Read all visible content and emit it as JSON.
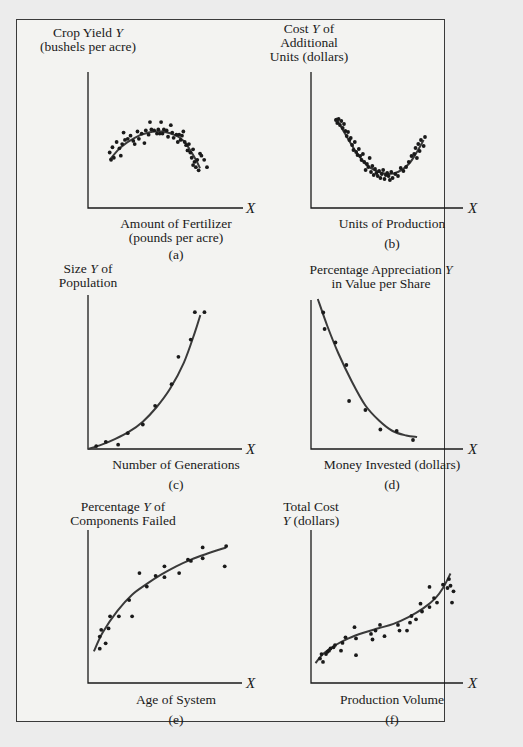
{
  "figure": {
    "panels": [
      {
        "id": "a",
        "ylabel_lines": [
          "Crop Yield Y",
          "(bushels per acre)"
        ],
        "xlabel_lines": [
          "Amount of Fertilizer",
          "(pounds per acre)"
        ],
        "x_var": "X",
        "caption": "(a)"
      },
      {
        "id": "b",
        "ylabel_lines": [
          "Cost Y of",
          "Additional",
          "Units (dollars)"
        ],
        "xlabel_lines": [
          "Units of Production"
        ],
        "x_var": "X",
        "caption": "(b)"
      },
      {
        "id": "c",
        "ylabel_lines": [
          "Size Y of",
          "Population"
        ],
        "xlabel_lines": [
          "Number of Generations"
        ],
        "x_var": "X",
        "caption": "(c)"
      },
      {
        "id": "d",
        "ylabel_lines": [
          "Percentage Appreciation Y",
          "in Value per Share"
        ],
        "xlabel_lines": [
          "Money Invested (dollars)"
        ],
        "x_var": "X",
        "caption": "(d)"
      },
      {
        "id": "e",
        "ylabel_lines": [
          "Percentage Y of",
          "Components Failed"
        ],
        "xlabel_lines": [
          "Age of System"
        ],
        "x_var": "X",
        "caption": "(e)"
      },
      {
        "id": "f",
        "ylabel_lines": [
          "Total Cost",
          "Y (dollars)"
        ],
        "xlabel_lines": [
          "Production Volume"
        ],
        "x_var": "X",
        "caption": "(f)"
      }
    ],
    "colors": {
      "ink": "#1a1a1a",
      "curve": "#3a3a3a",
      "paper": "#f3f3f1",
      "background": "#ececec"
    }
  },
  "chart_data": [
    {
      "id": "a",
      "type": "scatter",
      "title": "",
      "xlabel": "Amount of Fertilizer (pounds per acre)",
      "ylabel": "Crop Yield Y (bushels per acre)",
      "grid": false,
      "legend": null,
      "ticks": "none",
      "fit": "quadratic (concave, inverted U)",
      "xlim": [
        0,
        100
      ],
      "ylim": [
        0,
        100
      ],
      "points": [
        [
          12,
          50
        ],
        [
          13,
          43
        ],
        [
          14,
          55
        ],
        [
          15,
          45
        ],
        [
          17,
          60
        ],
        [
          19,
          54
        ],
        [
          20,
          47
        ],
        [
          21,
          58
        ],
        [
          22,
          69
        ],
        [
          23,
          62
        ],
        [
          25,
          63
        ],
        [
          27,
          66
        ],
        [
          29,
          61
        ],
        [
          30,
          58
        ],
        [
          32,
          70
        ],
        [
          33,
          63
        ],
        [
          35,
          68
        ],
        [
          37,
          59
        ],
        [
          38,
          71
        ],
        [
          40,
          67
        ],
        [
          41,
          79
        ],
        [
          42,
          72
        ],
        [
          44,
          71
        ],
        [
          46,
          68
        ],
        [
          47,
          72
        ],
        [
          48,
          68
        ],
        [
          49,
          79
        ],
        [
          50,
          68
        ],
        [
          51,
          72
        ],
        [
          53,
          71
        ],
        [
          54,
          65
        ],
        [
          56,
          76
        ],
        [
          57,
          69
        ],
        [
          58,
          64
        ],
        [
          60,
          67
        ],
        [
          61,
          60
        ],
        [
          62,
          67
        ],
        [
          63,
          62
        ],
        [
          64,
          66
        ],
        [
          65,
          70
        ],
        [
          66,
          60
        ],
        [
          67,
          57
        ],
        [
          68,
          52
        ],
        [
          69,
          58
        ],
        [
          70,
          50
        ],
        [
          71,
          45
        ],
        [
          72,
          38
        ],
        [
          72,
          53
        ],
        [
          73,
          41
        ],
        [
          74,
          36
        ],
        [
          75,
          43
        ],
        [
          76,
          33
        ],
        [
          77,
          49
        ],
        [
          78,
          47
        ],
        [
          80,
          43
        ],
        [
          82,
          36
        ]
      ],
      "curve": [
        [
          12,
          43
        ],
        [
          20,
          55
        ],
        [
          30,
          64
        ],
        [
          40,
          69
        ],
        [
          50,
          70
        ],
        [
          60,
          66
        ],
        [
          66,
          60
        ],
        [
          70,
          52
        ],
        [
          74,
          43
        ],
        [
          77,
          35
        ]
      ]
    },
    {
      "id": "b",
      "type": "scatter",
      "title": "",
      "xlabel": "Units of Production",
      "ylabel": "Cost Y of Additional Units (dollars)",
      "grid": false,
      "legend": null,
      "ticks": "none",
      "fit": "quadratic (convex, U-shaped)",
      "xlim": [
        0,
        100
      ],
      "ylim": [
        0,
        100
      ],
      "points": [
        [
          14,
          80
        ],
        [
          15,
          77
        ],
        [
          16,
          81
        ],
        [
          17,
          75
        ],
        [
          18,
          79
        ],
        [
          19,
          72
        ],
        [
          20,
          76
        ],
        [
          21,
          69
        ],
        [
          22,
          64
        ],
        [
          23,
          68
        ],
        [
          24,
          60
        ],
        [
          25,
          62
        ],
        [
          26,
          55
        ],
        [
          27,
          50
        ],
        [
          28,
          58
        ],
        [
          29,
          48
        ],
        [
          30,
          45
        ],
        [
          31,
          51
        ],
        [
          32,
          44
        ],
        [
          33,
          40
        ],
        [
          34,
          46
        ],
        [
          35,
          38
        ],
        [
          36,
          30
        ],
        [
          37,
          36
        ],
        [
          38,
          33
        ],
        [
          39,
          42
        ],
        [
          40,
          28
        ],
        [
          41,
          34
        ],
        [
          42,
          25
        ],
        [
          43,
          31
        ],
        [
          44,
          27
        ],
        [
          45,
          24
        ],
        [
          46,
          29
        ],
        [
          47,
          22
        ],
        [
          48,
          26
        ],
        [
          49,
          30
        ],
        [
          50,
          21
        ],
        [
          51,
          25
        ],
        [
          52,
          27
        ],
        [
          53,
          24
        ],
        [
          54,
          20
        ],
        [
          55,
          28
        ],
        [
          56,
          22
        ],
        [
          58,
          26
        ],
        [
          60,
          24
        ],
        [
          62,
          32
        ],
        [
          64,
          29
        ],
        [
          66,
          33
        ],
        [
          68,
          38
        ],
        [
          70,
          44
        ],
        [
          72,
          46
        ],
        [
          73,
          52
        ],
        [
          74,
          42
        ],
        [
          75,
          56
        ],
        [
          76,
          49
        ],
        [
          77,
          60
        ],
        [
          79,
          54
        ],
        [
          80,
          63
        ]
      ],
      "curve": [
        [
          14,
          82
        ],
        [
          20,
          68
        ],
        [
          28,
          50
        ],
        [
          36,
          36
        ],
        [
          44,
          29
        ],
        [
          52,
          26
        ],
        [
          60,
          28
        ],
        [
          68,
          36
        ],
        [
          74,
          48
        ],
        [
          79,
          60
        ]
      ]
    },
    {
      "id": "c",
      "type": "scatter",
      "title": "",
      "xlabel": "Number of Generations",
      "ylabel": "Size Y of Population",
      "grid": false,
      "legend": null,
      "ticks": "none",
      "fit": "exponential growth",
      "xlim": [
        0,
        100
      ],
      "ylim": [
        0,
        100
      ],
      "points": [
        [
          6,
          2
        ],
        [
          13,
          5
        ],
        [
          22,
          3
        ],
        [
          29,
          11
        ],
        [
          40,
          17
        ],
        [
          49,
          30
        ],
        [
          61,
          45
        ],
        [
          66,
          64
        ],
        [
          75,
          76
        ],
        [
          78,
          95
        ],
        [
          85,
          95
        ]
      ],
      "curve": [
        [
          0,
          0
        ],
        [
          10,
          3
        ],
        [
          20,
          7
        ],
        [
          30,
          12
        ],
        [
          40,
          19
        ],
        [
          50,
          29
        ],
        [
          60,
          42
        ],
        [
          70,
          60
        ],
        [
          78,
          81
        ],
        [
          82,
          93
        ]
      ]
    },
    {
      "id": "d",
      "type": "scatter",
      "title": "",
      "xlabel": "Money Invested (dollars)",
      "ylabel": "Percentage Appreciation Y in Value per Share",
      "grid": false,
      "legend": null,
      "ticks": "none",
      "fit": "exponential decay",
      "xlim": [
        0,
        100
      ],
      "ylim": [
        0,
        100
      ],
      "points": [
        [
          9,
          89
        ],
        [
          10,
          78
        ],
        [
          18,
          69
        ],
        [
          26,
          54
        ],
        [
          28,
          30
        ],
        [
          40,
          24
        ],
        [
          51,
          11
        ],
        [
          63,
          10
        ],
        [
          75,
          4
        ]
      ],
      "curve": [
        [
          5,
          98
        ],
        [
          12,
          80
        ],
        [
          20,
          62
        ],
        [
          30,
          43
        ],
        [
          40,
          27
        ],
        [
          50,
          17
        ],
        [
          60,
          10
        ],
        [
          70,
          7
        ],
        [
          78,
          6
        ]
      ]
    },
    {
      "id": "e",
      "type": "scatter",
      "title": "",
      "xlabel": "Age of System",
      "ylabel": "Percentage Y of Components Failed",
      "grid": false,
      "legend": null,
      "ticks": "none",
      "fit": "logarithmic (concave increasing)",
      "xlim": [
        0,
        100
      ],
      "ylim": [
        0,
        100
      ],
      "points": [
        [
          8,
          18
        ],
        [
          8,
          27
        ],
        [
          9,
          32
        ],
        [
          12,
          22
        ],
        [
          14,
          33
        ],
        [
          15,
          42
        ],
        [
          21,
          42
        ],
        [
          28,
          54
        ],
        [
          30,
          42
        ],
        [
          35,
          74
        ],
        [
          40,
          64
        ],
        [
          46,
          72
        ],
        [
          52,
          71
        ],
        [
          52,
          79
        ],
        [
          62,
          74
        ],
        [
          68,
          84
        ],
        [
          70,
          83
        ],
        [
          78,
          85
        ],
        [
          78,
          93
        ],
        [
          93,
          79
        ],
        [
          94,
          94
        ]
      ],
      "curve": [
        [
          4,
          16
        ],
        [
          10,
          30
        ],
        [
          20,
          46
        ],
        [
          30,
          58
        ],
        [
          40,
          66
        ],
        [
          50,
          73
        ],
        [
          60,
          79
        ],
        [
          70,
          84
        ],
        [
          80,
          88
        ],
        [
          94,
          93
        ]
      ]
    },
    {
      "id": "f",
      "type": "scatter",
      "title": "",
      "xlabel": "Production Volume",
      "ylabel": "Total Cost Y (dollars)",
      "grid": false,
      "legend": null,
      "ticks": "none",
      "fit": "cubic",
      "xlim": [
        0,
        100
      ],
      "ylim": [
        0,
        100
      ],
      "points": [
        [
          6,
          12
        ],
        [
          7,
          16
        ],
        [
          8,
          9
        ],
        [
          10,
          16
        ],
        [
          11,
          18
        ],
        [
          12,
          19
        ],
        [
          13,
          21
        ],
        [
          15,
          22
        ],
        [
          16,
          24
        ],
        [
          20,
          19
        ],
        [
          21,
          26
        ],
        [
          23,
          31
        ],
        [
          29,
          40
        ],
        [
          30,
          30
        ],
        [
          30,
          15
        ],
        [
          40,
          34
        ],
        [
          41,
          29
        ],
        [
          43,
          37
        ],
        [
          46,
          42
        ],
        [
          49,
          32
        ],
        [
          58,
          42
        ],
        [
          59,
          37
        ],
        [
          64,
          37
        ],
        [
          66,
          44
        ],
        [
          67,
          50
        ],
        [
          70,
          47
        ],
        [
          73,
          61
        ],
        [
          74,
          54
        ],
        [
          79,
          58
        ],
        [
          79,
          76
        ],
        [
          82,
          66
        ],
        [
          84,
          62
        ],
        [
          88,
          78
        ],
        [
          91,
          75
        ],
        [
          92,
          83
        ],
        [
          93,
          77
        ],
        [
          94,
          62
        ],
        [
          95,
          72
        ]
      ],
      "curve": [
        [
          3,
          8
        ],
        [
          8,
          16
        ],
        [
          15,
          23
        ],
        [
          25,
          30
        ],
        [
          35,
          35
        ],
        [
          45,
          39
        ],
        [
          55,
          43
        ],
        [
          65,
          49
        ],
        [
          75,
          57
        ],
        [
          83,
          66
        ],
        [
          88,
          75
        ],
        [
          93,
          88
        ]
      ]
    }
  ]
}
